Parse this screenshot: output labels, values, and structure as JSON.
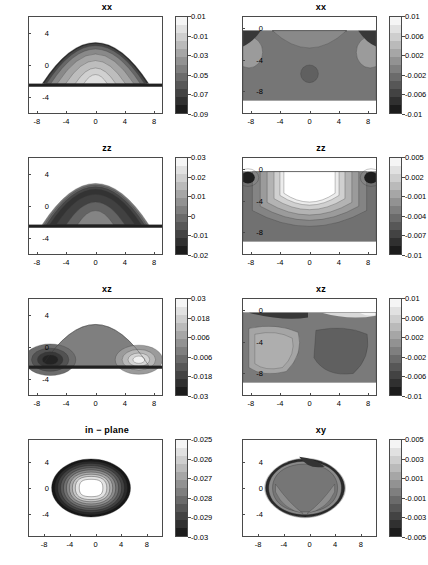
{
  "figure": {
    "width": 428,
    "height": 565,
    "rows": 4,
    "cols": 2,
    "background": "#ffffff",
    "line_color": "#4a4a4a"
  },
  "chart_data": [
    {
      "type": "heatmap",
      "title": "xx",
      "position": "row1-col1",
      "xlabel": "",
      "ylabel": "",
      "xlim": [
        -9.2,
        9.2
      ],
      "ylim": [
        -6.2,
        6.2
      ],
      "xticks": [
        -8,
        -4,
        0,
        4,
        8
      ],
      "xticklabels": [
        "-8",
        "-4",
        "0",
        "4",
        "8"
      ],
      "yticks": [
        4,
        0,
        -4
      ],
      "yticklabels": [
        "4",
        "0",
        "-4"
      ],
      "grid": false,
      "legend": "none",
      "colorbar": {
        "ticks": [
          0.01,
          -0.01,
          -0.03,
          -0.05,
          -0.07,
          -0.09
        ],
        "ticklabels": [
          "0.01",
          "-0.01",
          "-0.03",
          "-0.05",
          "-0.07",
          "-0.09"
        ],
        "vmin": -0.09,
        "vmax": 0.01,
        "cmap": "gray"
      },
      "shape": "dome",
      "notes": "Lens/dome shaped region above a thin dark substrate layer at y=-1.8; values most negative (dark) near base, rising toward 0.01 (light) at dome top."
    },
    {
      "type": "heatmap",
      "title": "xx",
      "position": "row1-col2",
      "xlabel": "",
      "ylabel": "",
      "xlim": [
        -9.2,
        9.2
      ],
      "ylim": [
        -11.0,
        1.6
      ],
      "xticks": [
        -8,
        -4,
        0,
        4,
        8
      ],
      "xticklabels": [
        "-8",
        "-4",
        "0",
        "4",
        "8"
      ],
      "yticks": [
        0,
        -4,
        -8
      ],
      "yticklabels": [
        "0",
        "-4",
        "-8"
      ],
      "grid": false,
      "legend": "none",
      "colorbar": {
        "ticks": [
          0.01,
          0.006,
          0.002,
          -0.002,
          -0.006,
          -0.01
        ],
        "ticklabels": [
          "0.01",
          "0.006",
          "0.002",
          "-0.002",
          "-0.006",
          "-0.01"
        ],
        "vmin": -0.01,
        "vmax": 0.01,
        "cmap": "gray"
      },
      "shape": "substrate",
      "notes": "Rectangular substrate field; light arcs just below surface at centre, two light lobes at left and right edges near y=-4, small darker blob at centre y=-6.5."
    },
    {
      "type": "heatmap",
      "title": "zz",
      "position": "row2-col1",
      "xlabel": "",
      "ylabel": "",
      "xlim": [
        -9.2,
        9.2
      ],
      "ylim": [
        -6.2,
        6.2
      ],
      "xticks": [
        -8,
        -4,
        0,
        4,
        8
      ],
      "xticklabels": [
        "-8",
        "-4",
        "0",
        "4",
        "8"
      ],
      "yticks": [
        4,
        0,
        -4
      ],
      "yticklabels": [
        "4",
        "0",
        "-4"
      ],
      "grid": false,
      "legend": "none",
      "colorbar": {
        "ticks": [
          0.03,
          0.02,
          0.01,
          0,
          -0.01,
          -0.02
        ],
        "ticklabels": [
          "0.03",
          "0.02",
          "0.01",
          "0",
          "-0.01",
          "-0.02"
        ],
        "vmin": -0.02,
        "vmax": 0.03,
        "cmap": "gray"
      },
      "shape": "dome",
      "notes": "Dome with darkest band hugging the upper curved boundary, lightening downward toward the base."
    },
    {
      "type": "heatmap",
      "title": "zz",
      "position": "row2-col2",
      "xlabel": "",
      "ylabel": "",
      "xlim": [
        -9.2,
        9.2
      ],
      "ylim": [
        -11.0,
        1.6
      ],
      "xticks": [
        -8,
        -4,
        0,
        4,
        8
      ],
      "xticklabels": [
        "-8",
        "-4",
        "0",
        "4",
        "8"
      ],
      "yticks": [
        0,
        -4,
        -8
      ],
      "yticklabels": [
        "0",
        "-4",
        "-8"
      ],
      "grid": false,
      "legend": "none",
      "colorbar": {
        "ticks": [
          0.005,
          0.002,
          -0.001,
          -0.004,
          -0.007,
          -0.01
        ],
        "ticklabels": [
          "0.005",
          "0.002",
          "-0.001",
          "-0.004",
          "-0.007",
          "-0.01"
        ],
        "vmin": -0.01,
        "vmax": 0.005,
        "cmap": "gray"
      },
      "shape": "substrate",
      "notes": "Large white U-shaped high-value region centred under the surface, concentric grey contours outside it, two very dark spots at upper-left and upper-right corners."
    },
    {
      "type": "heatmap",
      "title": "xz",
      "position": "row3-col1",
      "xlabel": "",
      "ylabel": "",
      "xlim": [
        -9.2,
        9.2
      ],
      "ylim": [
        -6.2,
        6.2
      ],
      "xticks": [
        -8,
        -4,
        0,
        4,
        8
      ],
      "xticklabels": [
        "-8",
        "-4",
        "0",
        "4",
        "8"
      ],
      "yticks": [
        4,
        0,
        -4
      ],
      "yticklabels": [
        "4",
        "0",
        "-4"
      ],
      "grid": false,
      "legend": "none",
      "colorbar": {
        "ticks": [
          0.03,
          0.018,
          0.006,
          -0.006,
          -0.018,
          -0.03
        ],
        "ticklabels": [
          "0.03",
          "0.018",
          "0.006",
          "-0.006",
          "-0.018",
          "-0.03"
        ],
        "vmin": -0.03,
        "vmax": 0.03,
        "cmap": "gray"
      },
      "shape": "dome",
      "notes": "Antisymmetric dome: dark (negative) nested lobes at lower-left corner, light (positive) nested lobes at lower-right corner, mid grey through the centre."
    },
    {
      "type": "heatmap",
      "title": "xz",
      "position": "row3-col2",
      "xlabel": "",
      "ylabel": "",
      "xlim": [
        -9.2,
        9.2
      ],
      "ylim": [
        -11.0,
        1.6
      ],
      "xticks": [
        -8,
        -4,
        0,
        4,
        8
      ],
      "xticklabels": [
        "-8",
        "-4",
        "0",
        "4",
        "8"
      ],
      "yticks": [
        0,
        -4,
        -8
      ],
      "yticklabels": [
        "0",
        "-4",
        "-8"
      ],
      "grid": false,
      "legend": "none",
      "colorbar": {
        "ticks": [
          0.01,
          0.006,
          0.002,
          -0.002,
          -0.006,
          -0.01
        ],
        "ticklabels": [
          "0.01",
          "0.006",
          "0.002",
          "-0.002",
          "-0.006",
          "-0.01"
        ],
        "vmin": -0.01,
        "vmax": 0.01,
        "cmap": "gray"
      },
      "shape": "substrate",
      "notes": "Light lobe on the left half, darker lobe on the right half, dark band along the top-left surface and a light patch at top-right."
    },
    {
      "type": "heatmap",
      "title": "in − plane",
      "position": "row4-col1",
      "xlabel": "",
      "ylabel": "",
      "xlim": [
        -10.5,
        10.5
      ],
      "ylim": [
        -7.6,
        7.6
      ],
      "xticks": [
        -8,
        -4,
        0,
        4,
        8
      ],
      "xticklabels": [
        "-8",
        "-4",
        "0",
        "4",
        "8"
      ],
      "yticks": [
        4,
        0,
        -4
      ],
      "yticklabels": [
        "4",
        "0",
        "-4"
      ],
      "grid": false,
      "legend": "none",
      "colorbar": {
        "ticks": [
          -0.025,
          -0.026,
          -0.027,
          -0.028,
          -0.029,
          -0.03
        ],
        "ticklabels": [
          "-0.025",
          "-0.026",
          "-0.027",
          "-0.028",
          "-0.029",
          "-0.03"
        ],
        "vmin": -0.03,
        "vmax": -0.025,
        "cmap": "gray"
      },
      "shape": "diamond-rings",
      "notes": "Plan-view rounded-diamond island with concentric contour rings; white/light core at centre grading through greys to black at the rim."
    },
    {
      "type": "heatmap",
      "title": "xy",
      "position": "row4-col2",
      "xlabel": "",
      "ylabel": "",
      "xlim": [
        -10.5,
        10.5
      ],
      "ylim": [
        -7.6,
        7.6
      ],
      "xticks": [
        -8,
        -4,
        0,
        4,
        8
      ],
      "xticklabels": [
        "-8",
        "-4",
        "0",
        "4",
        "8"
      ],
      "yticks": [
        4,
        0,
        -4
      ],
      "yticklabels": [
        "4",
        "0",
        "-4"
      ],
      "grid": false,
      "legend": "none",
      "colorbar": {
        "ticks": [
          0.005,
          0.003,
          0.001,
          -0.001,
          -0.003,
          -0.005
        ],
        "ticklabels": [
          "0.005",
          "0.003",
          "0.001",
          "-0.001",
          "-0.003",
          "-0.005"
        ],
        "vmin": -0.005,
        "vmax": 0.005,
        "cmap": "gray"
      },
      "shape": "diamond-flat",
      "notes": "Plan-view rounded-diamond island, nearly uniform mid-grey interior with a dark ragged border ring and lighter grey wedges near the corners."
    }
  ]
}
